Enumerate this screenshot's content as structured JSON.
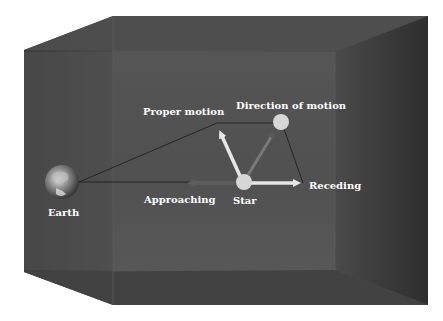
{
  "diagram": {
    "labels": {
      "earth": "Earth",
      "star": "Star",
      "proper_motion": "Proper motion",
      "direction_of_motion": "Direction of motion",
      "receding": "Receding",
      "approaching": "Approaching"
    },
    "colors": {
      "background": "#ffffff",
      "box_face": "#4a4a4a",
      "box_side": "#3a3a3a",
      "box_top": "#555555",
      "label": "#ffffff",
      "star": "#d6d6d6",
      "arrow_light": "#e0e0e0",
      "arrow_dark": "#6a6a6a"
    }
  }
}
